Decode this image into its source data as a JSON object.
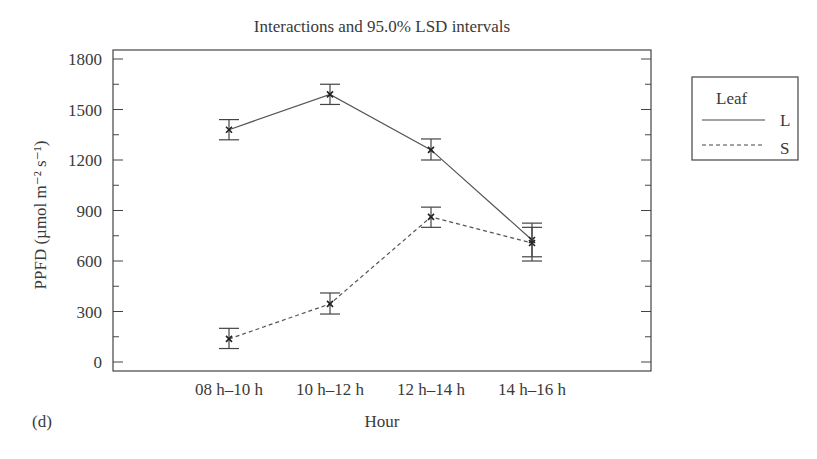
{
  "chart_data": {
    "type": "line",
    "title": "Interactions and 95.0% LSD intervals",
    "xlabel": "Hour",
    "ylabel": "PPFD (µmol m⁻² s⁻¹)",
    "panel_label": "(d)",
    "categories": [
      "08 h–10 h",
      "10 h–12 h",
      "12 h–14 h",
      "14 h–16 h"
    ],
    "ylim": [
      0,
      1800
    ],
    "yticks": [
      0,
      300,
      600,
      900,
      1200,
      1500,
      1800
    ],
    "minor_tick_step": 150,
    "grid": false,
    "legend": {
      "title": "Leaf",
      "position": "right-outside"
    },
    "series": [
      {
        "name": "L",
        "style": "solid",
        "values": [
          1380,
          1590,
          1260,
          725
        ],
        "lower": [
          1320,
          1530,
          1200,
          625
        ],
        "upper": [
          1440,
          1650,
          1325,
          825
        ]
      },
      {
        "name": "S",
        "style": "dashed",
        "values": [
          137,
          345,
          862,
          707
        ],
        "lower": [
          80,
          285,
          800,
          600
        ],
        "upper": [
          200,
          410,
          920,
          800
        ]
      }
    ]
  }
}
